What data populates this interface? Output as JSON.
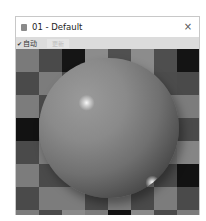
{
  "window": {
    "title": "01 - Default",
    "close_label": "×",
    "icon": "material-slot-icon"
  },
  "toolbar": {
    "auto_check_mark": "✔",
    "auto_label": "自动",
    "auto_checked": true,
    "update_label": "更新",
    "update_enabled": false
  },
  "viewport": {
    "content": "material-preview-sphere",
    "background": "checkerboard",
    "checker_cols": 8,
    "checker_rows": 8,
    "checker_cells": [
      [
        "#7a7a7a",
        "#4a4a4a",
        "#151515",
        "#8c8c8c",
        "#505050",
        "#8c8c8c",
        "#4e4e4e",
        "#141414"
      ],
      [
        "#4a4a4a",
        "#7c7c7c",
        "#4a4a4a",
        "#8a8a8a",
        "#8a8a8a",
        "#8a8a8a",
        "#4c4c4c",
        "#4a4a4a"
      ],
      [
        "#7c7c7c",
        "#4a4a4a",
        "#7c7c7c",
        "#4a4a4a",
        "#7c7c7c",
        "#4a4a4a",
        "#7c7c7c",
        "#7c7c7c"
      ],
      [
        "#121212",
        "#7a7a7a",
        "#4a4a4a",
        "#7c7c7c",
        "#4a4a4a",
        "#7c7c7c",
        "#4a4a4a",
        "#4a4a4a"
      ],
      [
        "#4a4a4a",
        "#7c7c7c",
        "#7c7c7c",
        "#4a4a4a",
        "#7c7c7c",
        "#4a4a4a",
        "#7c7c7c",
        "#858585"
      ],
      [
        "#7c7c7c",
        "#4a4a4a",
        "#4a4a4a",
        "#7c7c7c",
        "#4a4a4a",
        "#7c7c7c",
        "#4a4a4a",
        "#121212"
      ],
      [
        "#4a4a4a",
        "#7c7c7c",
        "#7c7c7c",
        "#4a4a4a",
        "#7c7c7c",
        "#4a4a4a",
        "#7c7c7c",
        "#4a4a4a"
      ],
      [
        "#7c7c7c",
        "#4a4a4a",
        "#8a8a8a",
        "#7c7c7c",
        "#121212",
        "#8a8a8a",
        "#4a4a4a",
        "#7c7c7c"
      ]
    ]
  }
}
